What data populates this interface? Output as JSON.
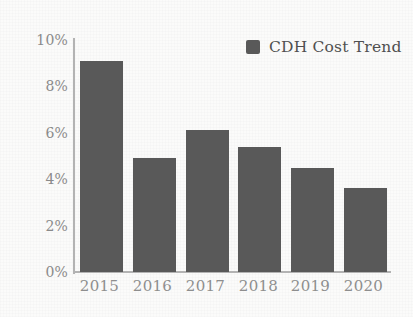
{
  "chart_data": {
    "type": "bar",
    "title": "",
    "xlabel": "",
    "ylabel": "",
    "categories": [
      "2015",
      "2016",
      "2017",
      "2018",
      "2019",
      "2020"
    ],
    "values": [
      9.1,
      4.9,
      6.1,
      5.4,
      4.5,
      3.6
    ],
    "value_suffix": "%",
    "ylim": [
      0,
      10
    ],
    "ytick_labels": [
      "10%",
      "8%",
      "6%",
      "4%",
      "2%",
      "0%"
    ],
    "ytick_values": [
      10,
      8,
      6,
      4,
      2,
      0
    ],
    "grid": false,
    "legend_position": "top-right",
    "series": [
      {
        "name": "CDH Cost Trend",
        "values": [
          9.1,
          4.9,
          6.1,
          5.4,
          4.5,
          3.6
        ]
      }
    ],
    "colors": {
      "bar": "#595959",
      "axis": "#b3b3b3",
      "tick_text": "#8a8a8a",
      "legend_text": "#4f4f4f",
      "background": "#fbfbfa"
    }
  },
  "legend": {
    "swatch_name": "legend-color-swatch",
    "label": "CDH Cost Trend"
  }
}
